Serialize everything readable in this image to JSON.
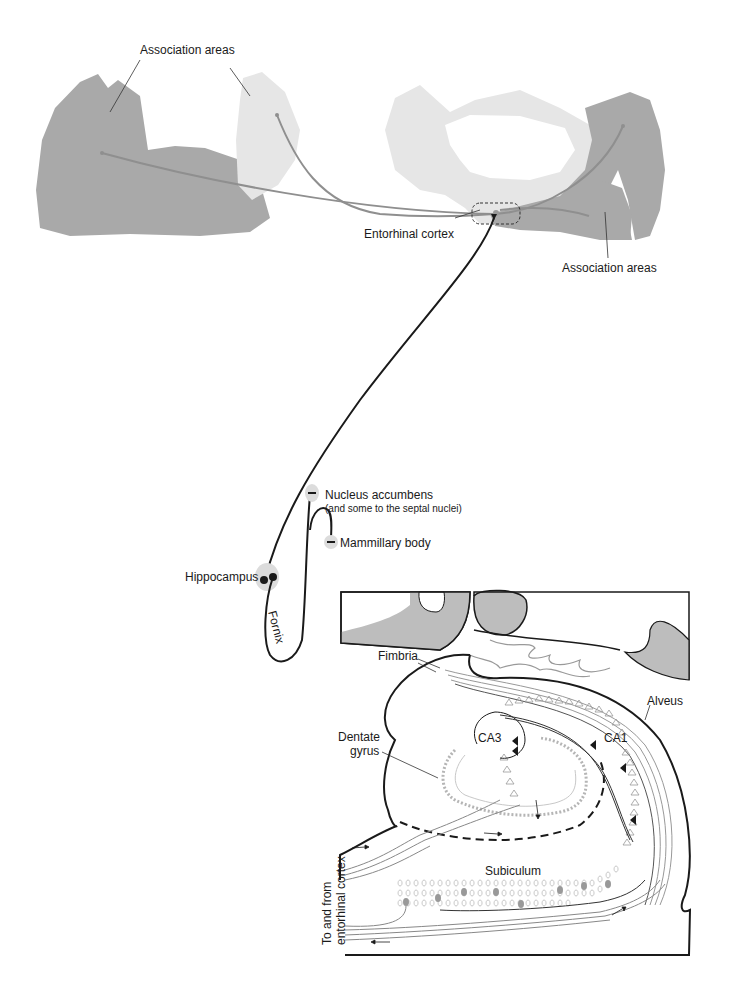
{
  "figure": {
    "top_panel": {
      "labels": {
        "association_areas_top": "Association areas",
        "entorhinal_cortex": "Entorhinal cortex",
        "association_areas_bottom": "Association areas"
      }
    },
    "pathway": {
      "labels": {
        "nucleus_accumbens": "Nucleus accumbens",
        "nucleus_accumbens_note": "(and some to the septal nuclei)",
        "mammillary_body": "Mammillary body",
        "hippocampus": "Hippocampus",
        "fornix": "Fornix"
      }
    },
    "hippocampal_section": {
      "labels": {
        "fimbria": "Fimbria",
        "alveus": "Alveus",
        "dentate_gyrus_line1": "Dentate",
        "dentate_gyrus_line2": "gyrus",
        "ca3": "CA3",
        "ca1": "CA1",
        "subiculum": "Subiculum",
        "to_from_line1": "To and from",
        "to_from_line2": "entorhinal cortex"
      }
    },
    "colors": {
      "dark_region": "#a9a9a9",
      "light_region": "#e4e4e4",
      "pathway_line": "#1a1a1a",
      "gray_line": "#999999",
      "section_fill": "#bdbdbd"
    }
  }
}
